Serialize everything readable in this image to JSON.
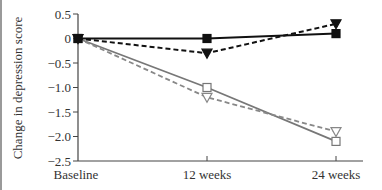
{
  "chart_data": {
    "type": "line",
    "title": "",
    "xlabel": "",
    "ylabel": "Change in depression score",
    "categories": [
      "Baseline",
      "12 weeks",
      "24 weeks"
    ],
    "ylim": [
      -2.5,
      0.5
    ],
    "yticks": [
      "0.5",
      "0",
      "−0.5",
      "−1.0",
      "−1.5",
      "−2.0",
      "−2.5"
    ],
    "ytick_values": [
      0.5,
      0,
      -0.5,
      -1.0,
      -1.5,
      -2.0,
      -2.5
    ],
    "grid": false,
    "legend": "none",
    "series": [
      {
        "name": "Filled square, solid black",
        "marker": "square-filled",
        "line": "solid",
        "color": "#111111",
        "values": [
          0,
          0.0,
          0.1
        ]
      },
      {
        "name": "Filled triangle, dashed black",
        "marker": "triangle-down-filled",
        "line": "dashed",
        "color": "#111111",
        "values": [
          0,
          -0.3,
          0.3
        ]
      },
      {
        "name": "Open square, solid gray",
        "marker": "square-open",
        "line": "solid",
        "color": "#777777",
        "values": [
          0,
          -1.0,
          -2.1
        ]
      },
      {
        "name": "Open triangle, dashed gray",
        "marker": "triangle-down-open",
        "line": "dashed",
        "color": "#888888",
        "values": [
          0,
          -1.2,
          -1.9
        ]
      }
    ]
  }
}
